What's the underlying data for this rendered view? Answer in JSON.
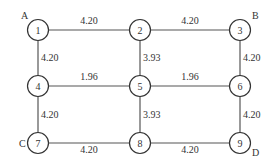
{
  "diagram": {
    "type": "grid-network",
    "nodes": [
      {
        "id": "1",
        "label": "1",
        "corner": "A"
      },
      {
        "id": "2",
        "label": "2"
      },
      {
        "id": "3",
        "label": "3",
        "corner": "B"
      },
      {
        "id": "4",
        "label": "4"
      },
      {
        "id": "5",
        "label": "5"
      },
      {
        "id": "6",
        "label": "6"
      },
      {
        "id": "7",
        "label": "7",
        "corner": "C"
      },
      {
        "id": "8",
        "label": "8"
      },
      {
        "id": "9",
        "label": "9",
        "corner": "D"
      }
    ],
    "edges": [
      {
        "from": "1",
        "to": "2",
        "weight": "4.20"
      },
      {
        "from": "2",
        "to": "3",
        "weight": "4.20"
      },
      {
        "from": "4",
        "to": "5",
        "weight": "1.96"
      },
      {
        "from": "5",
        "to": "6",
        "weight": "1.96"
      },
      {
        "from": "7",
        "to": "8",
        "weight": "4.20"
      },
      {
        "from": "8",
        "to": "9",
        "weight": "4.20"
      },
      {
        "from": "1",
        "to": "4",
        "weight": "4.20"
      },
      {
        "from": "4",
        "to": "7",
        "weight": "4.20"
      },
      {
        "from": "2",
        "to": "5",
        "weight": "3.93"
      },
      {
        "from": "5",
        "to": "8",
        "weight": "3.93"
      },
      {
        "from": "3",
        "to": "6",
        "weight": "4.20"
      },
      {
        "from": "6",
        "to": "9",
        "weight": "4.20"
      }
    ]
  }
}
